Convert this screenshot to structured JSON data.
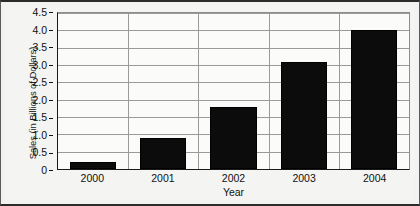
{
  "chart_data": {
    "type": "bar",
    "title": "",
    "subtitle": "",
    "xlabel": "Year",
    "ylabel": "Sales (in Billions of Dollars)",
    "categories": [
      "2000",
      "2001",
      "2002",
      "2003",
      "2004"
    ],
    "values": [
      0.2,
      0.9,
      1.8,
      3.1,
      4.0
    ],
    "ylim": [
      0,
      4.5
    ],
    "ytick_labels": [
      "0",
      "0.5",
      "1.0",
      "1.5",
      "2.0",
      "2.5",
      "3.0",
      "3.5",
      "4.0",
      "4.5"
    ],
    "ytick_values": [
      0,
      0.5,
      1.0,
      1.5,
      2.0,
      2.5,
      3.0,
      3.5,
      4.0,
      4.5
    ],
    "grid": "horizontal-and-category-separators",
    "legend": "none",
    "series": [
      {
        "name": "Sales",
        "values": [
          0.2,
          0.9,
          1.8,
          3.1,
          4.0
        ],
        "color": "#0c0c0c"
      }
    ],
    "colors": {
      "bar": "#0c0c0c",
      "grid": "#9a9a9a",
      "axis": "#1a1a1a",
      "plot_background": "#fbfbfa",
      "figure_background": "#f2f2f0",
      "text": "#111111"
    }
  }
}
